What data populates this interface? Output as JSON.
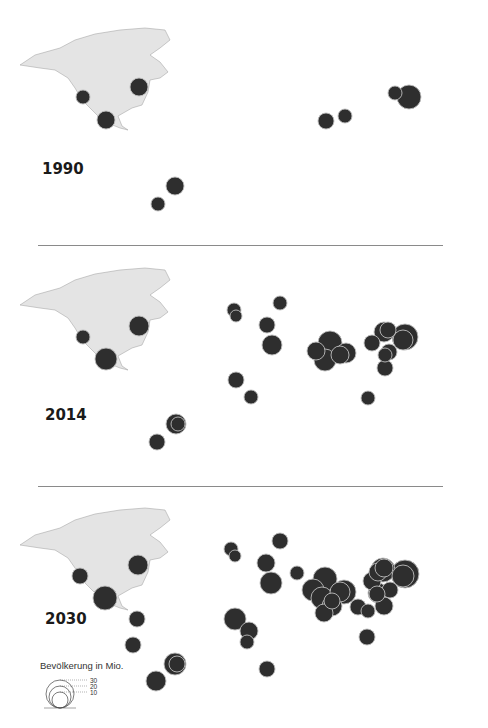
{
  "panels": [
    {
      "year": "1990",
      "top": 0,
      "cities": [
        {
          "cx": 83,
          "cy": 97,
          "r": 7
        },
        {
          "cx": 139,
          "cy": 87,
          "r": 9
        },
        {
          "cx": 106,
          "cy": 120,
          "r": 9
        },
        {
          "cx": 175,
          "cy": 186,
          "r": 9
        },
        {
          "cx": 158,
          "cy": 204,
          "r": 7
        },
        {
          "cx": 326,
          "cy": 121,
          "r": 8
        },
        {
          "cx": 345,
          "cy": 116,
          "r": 7
        },
        {
          "cx": 409,
          "cy": 97,
          "r": 12
        },
        {
          "cx": 395,
          "cy": 93,
          "r": 7
        }
      ]
    },
    {
      "year": "2014",
      "top": 240,
      "cities": [
        {
          "cx": 83,
          "cy": 97,
          "r": 7
        },
        {
          "cx": 139,
          "cy": 86,
          "r": 10
        },
        {
          "cx": 106,
          "cy": 119,
          "r": 11
        },
        {
          "cx": 234,
          "cy": 70,
          "r": 7
        },
        {
          "cx": 236,
          "cy": 76,
          "r": 6
        },
        {
          "cx": 280,
          "cy": 63,
          "r": 7
        },
        {
          "cx": 267,
          "cy": 85,
          "r": 8
        },
        {
          "cx": 272,
          "cy": 105,
          "r": 10
        },
        {
          "cx": 236,
          "cy": 140,
          "r": 8
        },
        {
          "cx": 251,
          "cy": 157,
          "r": 7
        },
        {
          "cx": 330,
          "cy": 103,
          "r": 12
        },
        {
          "cx": 316,
          "cy": 111,
          "r": 9
        },
        {
          "cx": 325,
          "cy": 120,
          "r": 11
        },
        {
          "cx": 346,
          "cy": 113,
          "r": 10
        },
        {
          "cx": 340,
          "cy": 115,
          "r": 9
        },
        {
          "cx": 372,
          "cy": 103,
          "r": 8
        },
        {
          "cx": 384,
          "cy": 92,
          "r": 10
        },
        {
          "cx": 388,
          "cy": 90,
          "r": 8
        },
        {
          "cx": 405,
          "cy": 97,
          "r": 13
        },
        {
          "cx": 403,
          "cy": 100,
          "r": 10
        },
        {
          "cx": 389,
          "cy": 112,
          "r": 8
        },
        {
          "cx": 385,
          "cy": 115,
          "r": 7
        },
        {
          "cx": 385,
          "cy": 128,
          "r": 8
        },
        {
          "cx": 368,
          "cy": 158,
          "r": 7
        },
        {
          "cx": 176,
          "cy": 184,
          "r": 10
        },
        {
          "cx": 178,
          "cy": 184,
          "r": 7
        },
        {
          "cx": 157,
          "cy": 202,
          "r": 8
        }
      ]
    },
    {
      "year": "2030",
      "top": 480,
      "cities": [
        {
          "cx": 80,
          "cy": 96,
          "r": 8
        },
        {
          "cx": 138,
          "cy": 85,
          "r": 10
        },
        {
          "cx": 105,
          "cy": 118,
          "r": 12
        },
        {
          "cx": 137,
          "cy": 139,
          "r": 8
        },
        {
          "cx": 133,
          "cy": 165,
          "r": 8
        },
        {
          "cx": 175,
          "cy": 184,
          "r": 11
        },
        {
          "cx": 177,
          "cy": 184,
          "r": 8
        },
        {
          "cx": 156,
          "cy": 201,
          "r": 10
        },
        {
          "cx": 231,
          "cy": 69,
          "r": 7
        },
        {
          "cx": 235,
          "cy": 76,
          "r": 6
        },
        {
          "cx": 280,
          "cy": 61,
          "r": 8
        },
        {
          "cx": 266,
          "cy": 83,
          "r": 9
        },
        {
          "cx": 271,
          "cy": 103,
          "r": 11
        },
        {
          "cx": 297,
          "cy": 93,
          "r": 7
        },
        {
          "cx": 235,
          "cy": 139,
          "r": 11
        },
        {
          "cx": 249,
          "cy": 151,
          "r": 9
        },
        {
          "cx": 247,
          "cy": 162,
          "r": 7
        },
        {
          "cx": 267,
          "cy": 189,
          "r": 8
        },
        {
          "cx": 313,
          "cy": 110,
          "r": 11
        },
        {
          "cx": 325,
          "cy": 99,
          "r": 12
        },
        {
          "cx": 322,
          "cy": 118,
          "r": 11
        },
        {
          "cx": 332,
          "cy": 126,
          "r": 10
        },
        {
          "cx": 324,
          "cy": 133,
          "r": 9
        },
        {
          "cx": 332,
          "cy": 121,
          "r": 8
        },
        {
          "cx": 344,
          "cy": 112,
          "r": 12
        },
        {
          "cx": 340,
          "cy": 112,
          "r": 10
        },
        {
          "cx": 358,
          "cy": 127,
          "r": 8
        },
        {
          "cx": 368,
          "cy": 131,
          "r": 7
        },
        {
          "cx": 372,
          "cy": 101,
          "r": 9
        },
        {
          "cx": 378,
          "cy": 92,
          "r": 9
        },
        {
          "cx": 383,
          "cy": 90,
          "r": 12
        },
        {
          "cx": 384,
          "cy": 88,
          "r": 9
        },
        {
          "cx": 390,
          "cy": 110,
          "r": 8
        },
        {
          "cx": 378,
          "cy": 113,
          "r": 10
        },
        {
          "cx": 377,
          "cy": 114,
          "r": 8
        },
        {
          "cx": 384,
          "cy": 126,
          "r": 9
        },
        {
          "cx": 405,
          "cy": 94,
          "r": 14
        },
        {
          "cx": 403,
          "cy": 96,
          "r": 11
        },
        {
          "cx": 367,
          "cy": 157,
          "r": 8
        }
      ]
    }
  ],
  "legend": {
    "title": "Bevölkerung in Mio.",
    "sizes": [
      {
        "label": "30",
        "r": 14
      },
      {
        "label": "20",
        "r": 11
      },
      {
        "label": "10",
        "r": 8
      }
    ]
  },
  "colors": {
    "land": "#e4e4e4",
    "land_stroke": "#9a9a9a",
    "city_fill": "#2e2e2e",
    "city_stroke": "#bdbdbd",
    "divider": "#8a8a8a"
  }
}
